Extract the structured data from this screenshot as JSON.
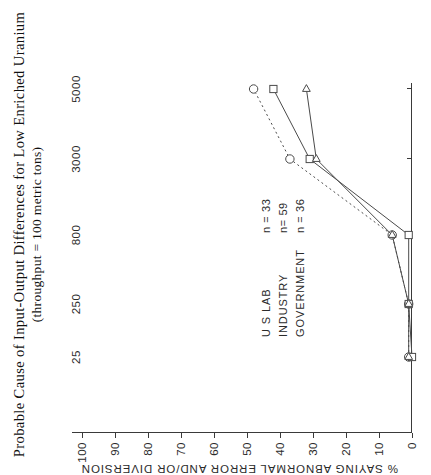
{
  "figure": {
    "title_line1": "Probable  Cause  of  Input-Output  Differences  for  Low  Enriched  Uranium",
    "title_line2": "(throughput = 100 metric tons)",
    "orientation": "rotated-90-ccw"
  },
  "legend": {
    "position": "inside-left",
    "entries": [
      {
        "name": "U S  LAB",
        "n_label": "n = 33",
        "marker": "circle",
        "line": "dashed"
      },
      {
        "name": "INDUSTRY",
        "n_label": "n= 59",
        "marker": "square",
        "line": "solid"
      },
      {
        "name": "GOVERNMENT",
        "n_label": "n = 36",
        "marker": "triangle",
        "line": "solid"
      }
    ]
  },
  "chart_data": {
    "type": "line",
    "title": "Probable Cause of Input-Output Differences for Low Enriched Uranium (throughput = 100 metric tons)",
    "xlabel": "",
    "ylabel": "% SAYING ABNORMAL ERROR AND/OR DIVERSION",
    "categories": [
      "25",
      "250",
      "800",
      "3000",
      "5000"
    ],
    "x_tick_labels": [
      "25",
      "250",
      "800",
      "3000",
      "5000"
    ],
    "y_tick_labels": [
      "0",
      "10",
      "20",
      "30",
      "40",
      "50",
      "60",
      "70",
      "80",
      "90",
      "100"
    ],
    "ylim": [
      0,
      100
    ],
    "grid": false,
    "legend_position": "inside-left",
    "series": [
      {
        "name": "U S  LAB",
        "n": 33,
        "marker": "circle",
        "line": "dashed",
        "values": [
          1,
          1,
          6,
          37,
          48
        ]
      },
      {
        "name": "INDUSTRY",
        "n": 59,
        "marker": "square",
        "line": "solid",
        "values": [
          0,
          1,
          1,
          31,
          42
        ]
      },
      {
        "name": "GOVERNMENT",
        "n": 36,
        "marker": "triangle",
        "line": "solid",
        "values": [
          1,
          1,
          6,
          29,
          32
        ]
      }
    ]
  }
}
